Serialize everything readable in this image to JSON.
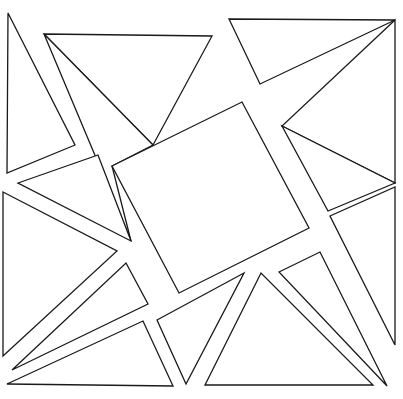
{
  "diagram": {
    "stroke_color": "#1a1a1a",
    "background": "#ffffff",
    "shapes": [
      {
        "name": "left-thin-triangle",
        "points": "8,13 75,145 7,173"
      },
      {
        "name": "top-triangle",
        "points": "44,34 212,36 153,145"
      },
      {
        "name": "top-left-sliver",
        "points": "44,34 153,145 112,166 131,241"
      },
      {
        "name": "left-mid-triangle",
        "points": "18,183 98,155 131,241"
      },
      {
        "name": "central-square",
        "points": "112,166 242,102 309,228 179,293"
      },
      {
        "name": "top-right-triangle",
        "points": "229,19 395,20 260,84"
      },
      {
        "name": "right-upper-triangle",
        "points": "395,20 282,126 395,183"
      },
      {
        "name": "right-mid-triangle",
        "points": "282,126 395,183 328,211"
      },
      {
        "name": "right-edge-triangle",
        "points": "395,187 395,345 330,216"
      },
      {
        "name": "bottom-right-triangle",
        "points": "279,272 320,252 387,386"
      },
      {
        "name": "bottom-center-triangle",
        "points": "205,385 261,273 373,385"
      },
      {
        "name": "bottom-small-triangle",
        "points": "157,320 244,273 186,384"
      },
      {
        "name": "bottom-left-triangle",
        "points": "7,384 143,321 173,386"
      },
      {
        "name": "left-large-triangle",
        "points": "3,192 117,251 3,356"
      },
      {
        "name": "left-lower-sliver",
        "points": "12,370 126,263 148,304"
      }
    ]
  }
}
